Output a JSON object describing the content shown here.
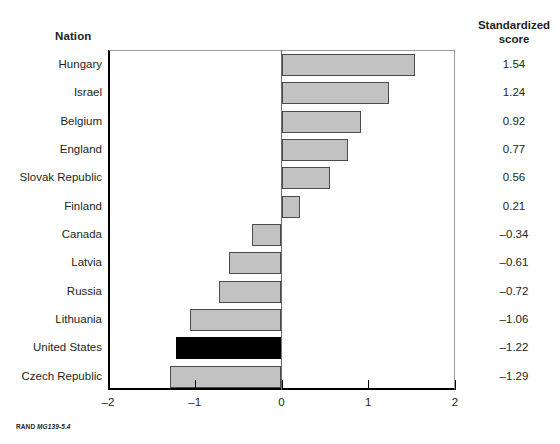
{
  "headers": {
    "nation": "Nation",
    "score_line1": "Standardized",
    "score_line2": "score"
  },
  "footer": {
    "prefix": "RAND ",
    "code": "MG139-5.4"
  },
  "colors": {
    "bar_fill": "#c2c2c2",
    "bar_stroke": "#4b4b4b",
    "highlight_fill": "#000000",
    "axis": "#000000",
    "frame": "#9a9a9a",
    "text": "#231f20"
  },
  "chart_data": {
    "type": "bar",
    "orientation": "horizontal",
    "title": "",
    "xlabel": "",
    "ylabel": "Nation",
    "value_axis_label": "Standardized score",
    "xlim": [
      -2,
      2
    ],
    "xticks": [
      -2,
      -1,
      0,
      1,
      2
    ],
    "xticklabels": [
      "–2",
      "–1",
      "0",
      "1",
      "2"
    ],
    "grid": false,
    "legend": false,
    "highlight_category": "United States",
    "categories": [
      "Hungary",
      "Israel",
      "Belgium",
      "England",
      "Slovak Republic",
      "Finland",
      "Canada",
      "Latvia",
      "Russia",
      "Lithuania",
      "United States",
      "Czech Republic"
    ],
    "values": [
      1.54,
      1.24,
      0.92,
      0.77,
      0.56,
      0.21,
      -0.34,
      -0.61,
      -0.72,
      -1.06,
      -1.22,
      -1.29
    ],
    "value_labels": [
      "1.54",
      "1.24",
      "0.92",
      "0.77",
      "0.56",
      "0.21",
      "–0.34",
      "–0.61",
      "–0.72",
      "–1.06",
      "–1.22",
      "–1.29"
    ]
  }
}
